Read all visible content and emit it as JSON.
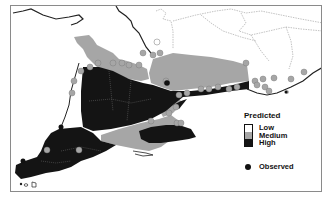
{
  "map": {
    "region": "Southern Ontario",
    "colors": {
      "low": "#ffffff",
      "medium": "#a6a6a6",
      "high": "#141414",
      "observed_point": "#111111",
      "predicted_point": "#a6a6a6",
      "boundary": "#222222",
      "admin_boundary": "#9a9a9a"
    }
  },
  "legend": {
    "title": "Predicted",
    "classes": [
      {
        "label": "Low",
        "color": "#ffffff"
      },
      {
        "label": "Medium",
        "color": "#a6a6a6"
      },
      {
        "label": "High",
        "color": "#141414"
      }
    ],
    "observed_label": "Observed"
  }
}
